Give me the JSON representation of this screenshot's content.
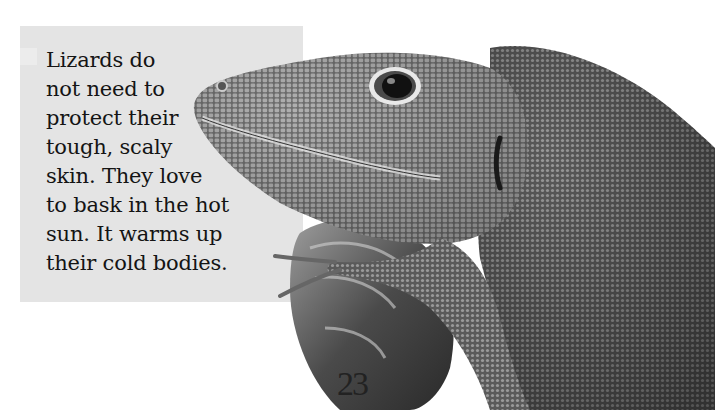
{
  "page": {
    "background": "#ffffff",
    "text_box": {
      "background": "#e4e4e4",
      "lines": [
        "Lizards do",
        "not need to",
        "protect their",
        "tough, scaly",
        "skin. They love",
        "to bask in the hot",
        "sun. It warms up",
        "their cold bodies."
      ]
    },
    "photo": {
      "subject": "close-up of a lizard (anole) resting its head and front leg on a broken branch",
      "style": "black-and-white photograph"
    },
    "page_number": "23"
  }
}
